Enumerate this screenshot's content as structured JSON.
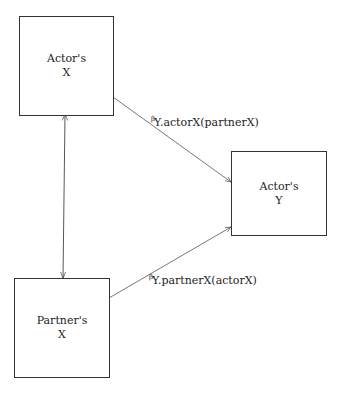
{
  "nodes": [
    {
      "id": "actor-x",
      "label": "Actor's\nX"
    },
    {
      "id": "actor-y",
      "label": "Actor's\nY"
    },
    {
      "id": "partner-x",
      "label": "Partner's\nX"
    }
  ],
  "edges": [
    {
      "from": "actor-x",
      "to": "actor-y",
      "symbol": "β",
      "label": "Y.actorX(partnerX)"
    },
    {
      "from": "partner-x",
      "to": "actor-y",
      "symbol": "β",
      "label": "Y.partnerX(actorX)"
    },
    {
      "from": "actor-x",
      "to": "partner-x",
      "symbol": "",
      "label": "",
      "bidirectional": true
    }
  ]
}
